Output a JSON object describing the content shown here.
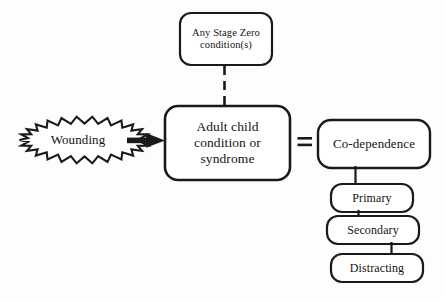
{
  "diagram": {
    "background_color": "#fdfdfb",
    "stroke_color": "#1a1a1a",
    "text_color": "#141414",
    "nodes": {
      "stage_zero": {
        "label": "Any Stage Zero\ncondition(s)",
        "shape": "rounded-rectangle"
      },
      "adult_child": {
        "label": "Adult child\ncondition or\nsyndrome",
        "shape": "rounded-rectangle"
      },
      "wounding": {
        "label": "Wounding",
        "shape": "starburst"
      },
      "codependence": {
        "label": "Co-dependence",
        "shape": "rounded-rectangle"
      },
      "primary": {
        "label": "Primary",
        "shape": "rounded-rectangle"
      },
      "secondary": {
        "label": "Secondary",
        "shape": "rounded-rectangle"
      },
      "distracting": {
        "label": "Distracting",
        "shape": "rounded-rectangle"
      }
    },
    "connectors": {
      "equals_sign": "=",
      "stage_zero_to_adult_child": "dashed-vertical-line",
      "wounding_to_adult_child": "thick-arrow-right",
      "codependence_to_primary": "solid-vertical-line",
      "primary_to_secondary": "solid-vertical-line",
      "secondary_to_distracting": "solid-vertical-line"
    }
  }
}
